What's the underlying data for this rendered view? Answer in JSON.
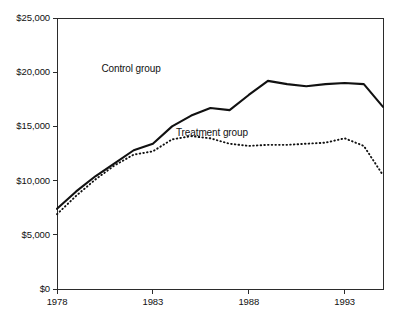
{
  "chart_data": {
    "type": "line",
    "title": "",
    "subtitle": "",
    "xlabel": "",
    "ylabel": "",
    "xlim": [
      1978,
      1995
    ],
    "ylim": [
      0,
      25000
    ],
    "grid": false,
    "legend_position": "inline-annotation",
    "x": [
      1978,
      1979,
      1980,
      1981,
      1982,
      1983,
      1984,
      1985,
      1986,
      1987,
      1988,
      1989,
      1990,
      1991,
      1992,
      1993,
      1994,
      1995
    ],
    "x_tick_labels": [
      "1978",
      "1983",
      "1988",
      "1993"
    ],
    "x_tick_values": [
      1978,
      1983,
      1988,
      1993
    ],
    "y_tick_labels": [
      "$25,000",
      "$20,000",
      "$15,000",
      "$10,000",
      "$5,000",
      "$0"
    ],
    "y_tick_values": [
      25000,
      20000,
      15000,
      10000,
      5000,
      0
    ],
    "series": [
      {
        "name": "Control group",
        "style": "solid",
        "color": "#111111",
        "label_text": "Control group",
        "values": [
          7400,
          9000,
          10400,
          11600,
          12800,
          13400,
          15000,
          16000,
          16700,
          16500,
          17900,
          19200,
          18900,
          18700,
          18900,
          19000,
          18900,
          16800
        ]
      },
      {
        "name": "Treatment group",
        "style": "dotted",
        "color": "#111111",
        "label_text": "Treatment group",
        "values": [
          6900,
          8600,
          10100,
          11400,
          12400,
          12700,
          13800,
          14100,
          13900,
          13400,
          13200,
          13300,
          13300,
          13400,
          13500,
          13900,
          13200,
          10500
        ]
      }
    ],
    "annotations": [
      {
        "text": "Control group",
        "x": 1982.4,
        "y": 20300
      },
      {
        "text": "Treatment group",
        "x": 1986.6,
        "y": 14350
      }
    ]
  }
}
